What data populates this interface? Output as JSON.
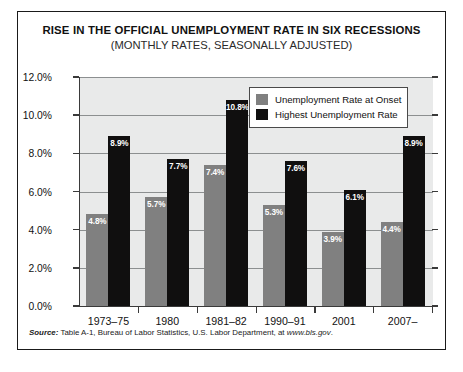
{
  "chart_data": {
    "type": "bar",
    "title": "RISE IN THE OFFICIAL UNEMPLOYMENT RATE IN SIX RECESSIONS",
    "subtitle": "(MONTHLY RATES, SEASONALLY ADJUSTED)",
    "categories": [
      "1973–75",
      "1980",
      "1981–82",
      "1990–91",
      "2001",
      "2007–"
    ],
    "series": [
      {
        "name": "Unemployment Rate at Onset",
        "color": "#808080",
        "values": [
          4.8,
          5.7,
          7.4,
          5.3,
          3.9,
          4.4
        ],
        "labels": [
          "4.8%",
          "5.7%",
          "7.4%",
          "5.3%",
          "3.9%",
          "4.4%"
        ]
      },
      {
        "name": "Highest Unemployment Rate",
        "color": "#100f0f",
        "values": [
          8.9,
          7.7,
          10.8,
          7.6,
          6.1,
          8.9
        ],
        "labels": [
          "8.9%",
          "7.7%",
          "10.8%",
          "7.6%",
          "6.1%",
          "8.9%"
        ]
      }
    ],
    "xlabel": "",
    "ylabel": "",
    "ylim": [
      0,
      12
    ],
    "ytick_values": [
      0,
      2,
      4,
      6,
      8,
      10,
      12
    ],
    "ytick_labels": [
      "0.0%",
      "2.0%",
      "4.0%",
      "6.0%",
      "8.0%",
      "10.0%",
      "12.0%"
    ],
    "grid": true,
    "legend_position": "upper right",
    "plot_background": "#e9eaea"
  },
  "legend": {
    "items": [
      {
        "label": "Unemployment Rate at Onset",
        "swatch": "onset"
      },
      {
        "label": "Highest Unemployment Rate",
        "swatch": "highest"
      }
    ]
  },
  "source": {
    "label": "Source:",
    "text": " Table A-1,  Bureau of Labor Statistics, U.S. Labor Department, at ",
    "url": "www.bls.gov",
    "period": "."
  }
}
